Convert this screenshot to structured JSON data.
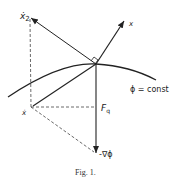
{
  "figure": {
    "caption": "Fig. 1.",
    "labels": {
      "x_dot_2": "ẋ",
      "x_dot_2_sub": "2",
      "x": "x",
      "phi_const": "ϕ = const",
      "x_dot": "ẋ",
      "F": "F",
      "F_sub": "q",
      "neg_grad_phi": "-∇ϕ"
    }
  },
  "geometry": {
    "origin": [
      96,
      64
    ],
    "x_dot_2_tip": [
      30,
      17
    ],
    "x_tip": [
      125,
      20
    ],
    "x_dot_point": [
      31,
      107
    ],
    "neg_grad_tip": [
      96,
      154
    ],
    "curve": [
      [
        8,
        97
      ],
      [
        96,
        64
      ],
      [
        156,
        80
      ]
    ]
  },
  "colors": {
    "ink": "#222222"
  }
}
